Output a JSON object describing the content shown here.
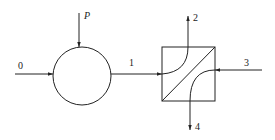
{
  "diagram": {
    "type": "process-flow",
    "nodes": [
      {
        "id": "mixer",
        "shape": "circle"
      },
      {
        "id": "exchanger",
        "shape": "square-with-diagonal-and-curves"
      }
    ],
    "streams": [
      {
        "label": "0",
        "from": "left-inlet",
        "to": "mixer"
      },
      {
        "label": "P",
        "from": "top-inlet",
        "to": "mixer"
      },
      {
        "label": "1",
        "from": "mixer",
        "to": "exchanger"
      },
      {
        "label": "2",
        "from": "exchanger",
        "to": "top-outlet"
      },
      {
        "label": "3",
        "from": "right-inlet",
        "to": "exchanger"
      },
      {
        "label": "4",
        "from": "exchanger",
        "to": "bottom-outlet"
      }
    ]
  },
  "labels": {
    "s0": "0",
    "sP": "P",
    "s1": "1",
    "s2": "2",
    "s3": "3",
    "s4": "4"
  }
}
